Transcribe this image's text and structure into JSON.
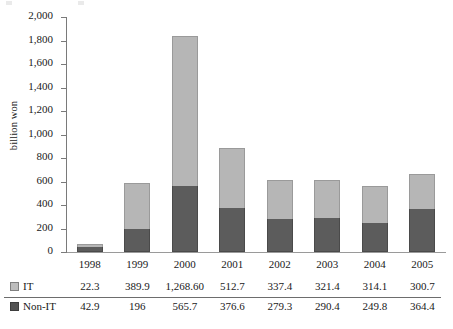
{
  "chart_data": {
    "type": "bar",
    "subtype": "stacked-column",
    "title": "",
    "xlabel": "",
    "ylabel": "billion won",
    "ylim": [
      0,
      2000
    ],
    "y_ticks": [
      "0",
      "200",
      "400",
      "600",
      "800",
      "1,000",
      "1,200",
      "1,400",
      "1,600",
      "1,800",
      "2,000"
    ],
    "y_tick_values": [
      0,
      200,
      400,
      600,
      800,
      1000,
      1200,
      1400,
      1600,
      1800,
      2000
    ],
    "grid": false,
    "legend_position": "data-table-left",
    "categories": [
      "1998",
      "1999",
      "2000",
      "2001",
      "2002",
      "2003",
      "2004",
      "2005"
    ],
    "series": [
      {
        "name": "Non-IT",
        "color": "#5c5c5c",
        "stack_order": 0,
        "values": [
          42.9,
          196,
          565.7,
          376.6,
          279.3,
          290.4,
          249.8,
          364.4
        ],
        "labels": [
          "42.9",
          "196",
          "565.7",
          "376.6",
          "279.3",
          "290.4",
          "249.8",
          "364.4"
        ]
      },
      {
        "name": "IT",
        "color": "#b6b6b6",
        "stack_order": 1,
        "values": [
          22.3,
          389.9,
          1268.6,
          512.7,
          337.4,
          321.4,
          314.1,
          300.7
        ],
        "labels": [
          "22.3",
          "389.9",
          "1,268.60",
          "512.7",
          "337.4",
          "321.4",
          "314.1",
          "300.7"
        ]
      }
    ],
    "totals": [
      65.2,
      585.9,
      1834.3,
      889.3,
      616.7,
      611.8,
      563.9,
      665.1
    ]
  },
  "axis": {
    "y_title": "billion won"
  },
  "table": {
    "row_it_label": "IT",
    "row_nonit_label": "Non-IT"
  }
}
